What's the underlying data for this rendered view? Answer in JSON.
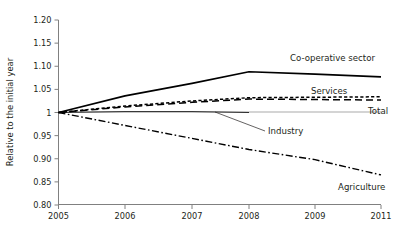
{
  "chart_data": {
    "type": "line",
    "title": "",
    "subtitle": "",
    "xlabel": "",
    "ylabel": "Relative to the initial year",
    "x": [
      2005,
      2006,
      2007,
      2008,
      2009,
      2011
    ],
    "xtick_labels": [
      "2005",
      "2006",
      "2007",
      "2008",
      "2009",
      "2011"
    ],
    "ytick_labels": [
      "1.20",
      "1.15",
      "1.10",
      "1.05",
      "1",
      "0.95",
      "0.90",
      "0.85",
      "0.80"
    ],
    "ytick_values": [
      1.2,
      1.15,
      1.1,
      1.05,
      1.0,
      0.95,
      0.9,
      0.85,
      0.8
    ],
    "ylim": [
      0.8,
      1.2
    ],
    "xlim": [
      2005,
      2011
    ],
    "grid": false,
    "legend_position": "inline-right-labels",
    "reference_line": 1.0,
    "series": [
      {
        "name": "Co-operative sector",
        "label": "Co-operative sector",
        "style": "solid",
        "width": 1.6,
        "color": "#000000",
        "x": [
          2005,
          2006,
          2007,
          2008,
          2009,
          2011
        ],
        "values": [
          1.0,
          1.036,
          1.063,
          1.088,
          1.083,
          1.077
        ]
      },
      {
        "name": "Services",
        "label": "Services",
        "style": "dotted-dash",
        "width": 1.5,
        "color": "#000000",
        "x": [
          2005,
          2006,
          2007,
          2008,
          2009,
          2011
        ],
        "values": [
          1.0,
          1.014,
          1.025,
          1.032,
          1.033,
          1.034
        ]
      },
      {
        "name": "Total",
        "label": "Total",
        "style": "dashed",
        "width": 1.5,
        "color": "#000000",
        "x": [
          2005,
          2006,
          2007,
          2008,
          2009,
          2011
        ],
        "values": [
          1.0,
          1.012,
          1.022,
          1.029,
          1.028,
          1.027
        ]
      },
      {
        "name": "Industry",
        "label": "Industry",
        "style": "thin-solid",
        "width": 0.8,
        "color": "#000000",
        "x": [
          2005,
          2006,
          2007,
          2008
        ],
        "values": [
          1.0,
          1.002,
          1.002,
          1.0
        ]
      },
      {
        "name": "Agriculture",
        "label": "Agriculture",
        "style": "dash-dot",
        "width": 1.4,
        "color": "#000000",
        "x": [
          2005,
          2006,
          2007,
          2008,
          2009,
          2011
        ],
        "values": [
          1.0,
          0.972,
          0.944,
          0.92,
          0.898,
          0.865
        ]
      }
    ],
    "annotations": [
      {
        "name": "Co-operative sector",
        "text": "Co-operative sector",
        "x": 290,
        "y": 61
      },
      {
        "name": "Services",
        "text": "Services",
        "x": 311,
        "y": 94
      },
      {
        "name": "Total",
        "text": "Total",
        "x": 368,
        "y": 114
      },
      {
        "name": "Industry",
        "text": "Industry",
        "x": 268,
        "y": 134
      },
      {
        "name": "Agriculture",
        "text": "Agriculture",
        "x": 338,
        "y": 190
      }
    ]
  }
}
